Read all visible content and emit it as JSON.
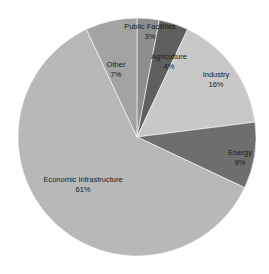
{
  "chart_data": {
    "type": "pie",
    "title": "",
    "start_angle_deg": 0,
    "direction": "clockwise",
    "categories": [
      "Public Facilities",
      "Agriculture",
      "Industry",
      "Energy",
      "Economic Infrastructure",
      "Other"
    ],
    "values": [
      3,
      4,
      16,
      9,
      61,
      7
    ],
    "labels": [
      "3%",
      "4%",
      "16%",
      "9%",
      "61%",
      "7%"
    ],
    "colors": [
      "#8e8e8e",
      "#5f5f5f",
      "#c8c8c8",
      "#6e6e6e",
      "#b8b8b8",
      "#a3a3a3"
    ],
    "legend": "none",
    "data_labels": "inside: category name + percent"
  },
  "slices": [
    {
      "name": "Public Facilities",
      "pct": "3%"
    },
    {
      "name": "Agriculture",
      "pct": "4%"
    },
    {
      "name": "Industry",
      "pct": "16%"
    },
    {
      "name": "Energy",
      "pct": "9%"
    },
    {
      "name": "Economic Infrastructure",
      "pct": "61%"
    },
    {
      "name": "Other",
      "pct": "7%"
    }
  ]
}
